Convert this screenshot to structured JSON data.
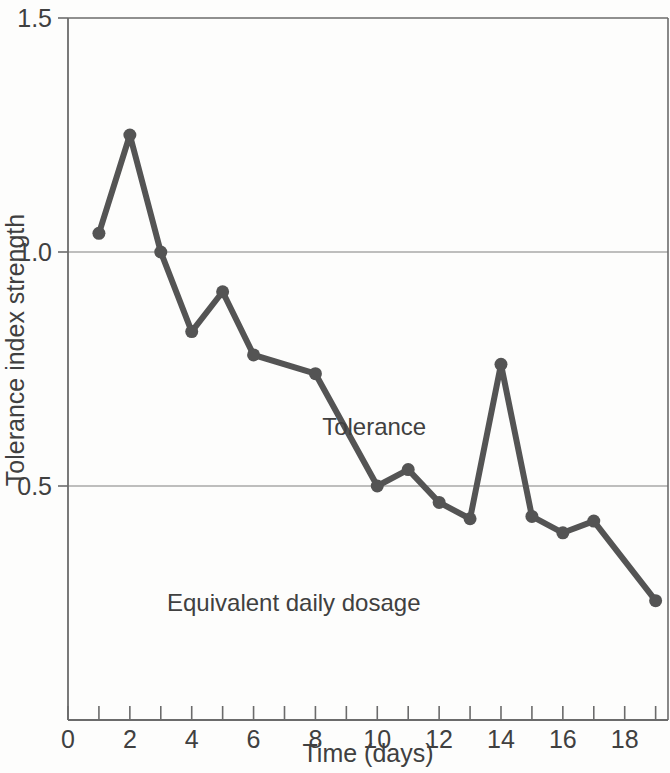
{
  "chart_data": {
    "type": "line",
    "title": "",
    "xlabel": "Time (days)",
    "ylabel": "Tolerance index strength",
    "xlim": [
      0,
      19.4
    ],
    "ylim": [
      0,
      1.5
    ],
    "grid": "horizontal gridlines at y = 0.5 and y = 1.0",
    "legend_position": "inline annotations on plot",
    "x_tick_values": [
      0,
      1,
      2,
      3,
      4,
      5,
      6,
      7,
      8,
      9,
      10,
      11,
      12,
      13,
      14,
      15,
      16,
      17,
      18,
      19
    ],
    "x_tick_labels": [
      "0",
      "",
      "2",
      "",
      "4",
      "",
      "6",
      "",
      "8",
      "",
      "10",
      "",
      "12",
      "",
      "14",
      "",
      "16",
      "",
      "18",
      ""
    ],
    "y_tick_values": [
      0.5,
      1.0,
      1.5
    ],
    "y_tick_labels": [
      "0.5",
      "1.0",
      "1.5"
    ],
    "gridline_values": [
      0.5,
      1.0
    ],
    "series": [
      {
        "name": "Tolerance",
        "color": "#545454",
        "marker": "circle",
        "x": [
          1,
          2,
          3,
          4,
          5,
          6,
          8,
          10,
          11,
          12,
          13,
          14,
          15,
          16,
          17,
          19
        ],
        "values": [
          1.04,
          1.25,
          1.0,
          0.83,
          0.915,
          0.78,
          0.74,
          0.5,
          0.535,
          0.465,
          0.43,
          0.76,
          0.435,
          0.4,
          0.425,
          0.255
        ]
      }
    ],
    "annotations": [
      {
        "text": "Tolerance",
        "x": 9.9,
        "y": 0.61
      },
      {
        "text": "Equivalent daily dosage",
        "x": 7.3,
        "y": 0.233
      }
    ]
  },
  "axes": {
    "y_title": "Tolerance index strength",
    "x_title": "Time (days)",
    "y_labels": [
      "1.5",
      "1.0",
      "0.5"
    ],
    "x_labels": [
      "0",
      "2",
      "4",
      "6",
      "8",
      "10",
      "12",
      "14",
      "16",
      "18"
    ]
  },
  "labels": {
    "tolerance": "Tolerance",
    "dosage": "Equivalent daily dosage"
  },
  "colors": {
    "line": "#545454",
    "marker": "#545454",
    "grid": "#aaaaaa",
    "axis": "#6b6b6b",
    "text": "#404040",
    "background": "#fdfdfc"
  }
}
